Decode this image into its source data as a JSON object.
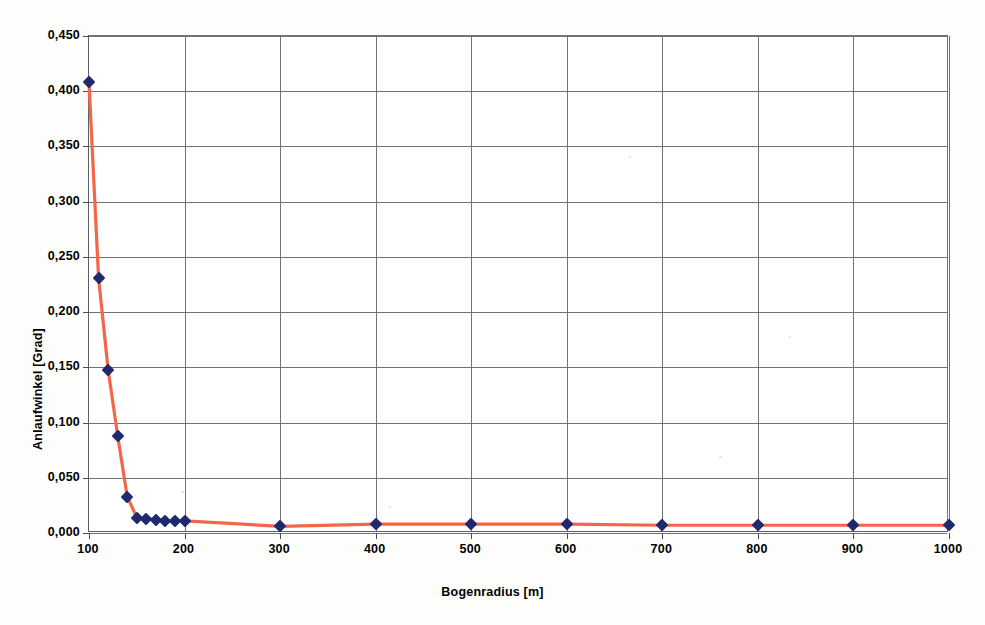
{
  "chart_data": {
    "type": "line",
    "title": "",
    "xlabel": "Bogenradius [m]",
    "ylabel": "Anlaufwinkel [Grad]",
    "xlim": [
      100,
      1000
    ],
    "ylim": [
      0.0,
      0.45
    ],
    "grid": true,
    "legend": "none",
    "x_tick_labels": [
      "100",
      "200",
      "300",
      "400",
      "500",
      "600",
      "700",
      "800",
      "900",
      "1000"
    ],
    "x_ticks": [
      100,
      200,
      300,
      400,
      500,
      600,
      700,
      800,
      900,
      1000
    ],
    "y_tick_labels": [
      "0,000",
      "0,050",
      "0,100",
      "0,150",
      "0,200",
      "0,250",
      "0,300",
      "0,350",
      "0,400",
      "0,450"
    ],
    "y_ticks": [
      0.0,
      0.05,
      0.1,
      0.15,
      0.2,
      0.25,
      0.3,
      0.35,
      0.4,
      0.45
    ],
    "series": [
      {
        "name": "Anlaufwinkel",
        "line_color": "#f4664a",
        "marker_color": "#1f2a6e",
        "marker": "diamond",
        "x": [
          100,
          110,
          120,
          130,
          140,
          150,
          160,
          170,
          180,
          190,
          200,
          300,
          400,
          500,
          600,
          700,
          800,
          900,
          1000
        ],
        "y": [
          0.408,
          0.231,
          0.148,
          0.088,
          0.033,
          0.014,
          0.013,
          0.012,
          0.011,
          0.011,
          0.011,
          0.006,
          0.008,
          0.008,
          0.008,
          0.007,
          0.007,
          0.007,
          0.007
        ]
      }
    ]
  },
  "figure": {
    "background_color": "#ffffff",
    "grid_color": "#6e737a",
    "axis_color": "#5a5f66",
    "text_color": "#000000"
  }
}
